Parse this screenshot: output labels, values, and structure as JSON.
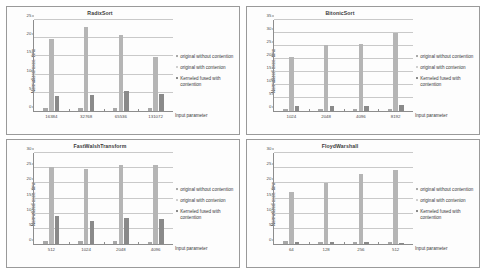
{
  "figure": {
    "xaxis_title": "Input parameter",
    "yaxis_title": "Normalized exec. time",
    "legend": [
      {
        "key": "s1",
        "label": "original without contention",
        "color": "#a8a8a8"
      },
      {
        "key": "s2",
        "label": "original with contenion",
        "color": "#cfcfcf"
      },
      {
        "key": "s3",
        "label": "Kerneled fused with contention",
        "color": "#8a8a8a"
      }
    ]
  },
  "chart_data": [
    {
      "type": "bar",
      "title": "RadixSort",
      "xlabel": "Input parameter",
      "ylabel": "Normalized exec. time",
      "categories": [
        "16384",
        "32768",
        "65536",
        "131072"
      ],
      "ylim": [
        0,
        25
      ],
      "yticks": [
        0,
        5,
        10,
        15,
        20,
        25
      ],
      "grid": true,
      "legend_position": "right",
      "series": [
        {
          "name": "original without contention",
          "values": [
            0.95,
            0.85,
            0.9,
            0.85
          ]
        },
        {
          "name": "original with contenion",
          "values": [
            19.7,
            23.0,
            20.9,
            14.9
          ]
        },
        {
          "name": "Kerneled fused with contention",
          "values": [
            4.1,
            4.3,
            5.4,
            4.8
          ]
        }
      ]
    },
    {
      "type": "bar",
      "title": "BitonicSort",
      "xlabel": "Input parameter",
      "ylabel": "Normalized exec. time",
      "categories": [
        "1024",
        "2048",
        "4096",
        "8192"
      ],
      "ylim": [
        0,
        35
      ],
      "yticks": [
        0,
        5,
        10,
        15,
        20,
        25,
        30,
        35
      ],
      "grid": true,
      "legend_position": "right",
      "series": [
        {
          "name": "original without contention",
          "values": [
            0.9,
            0.9,
            0.9,
            0.9
          ]
        },
        {
          "name": "original with contenion",
          "values": [
            20.8,
            25.4,
            25.8,
            30.0
          ]
        },
        {
          "name": "Kerneled fused with contention",
          "values": [
            1.8,
            1.8,
            2.0,
            2.5
          ]
        }
      ]
    },
    {
      "type": "bar",
      "title": "FastWalshTransform",
      "xlabel": "Input parameter",
      "ylabel": "Normalized exec. time",
      "categories": [
        "512",
        "1024",
        "2048",
        "4096"
      ],
      "ylim": [
        0,
        30
      ],
      "yticks": [
        0,
        5,
        10,
        15,
        20,
        25,
        30
      ],
      "grid": true,
      "legend_position": "right",
      "series": [
        {
          "name": "original without contention",
          "values": [
            0.9,
            0.85,
            0.85,
            0.8
          ]
        },
        {
          "name": "original with contenion",
          "values": [
            25.3,
            24.6,
            26.0,
            26.2
          ]
        },
        {
          "name": "Kerneled fused with contention",
          "values": [
            9.3,
            7.6,
            8.7,
            8.1
          ]
        }
      ]
    },
    {
      "type": "bar",
      "title": "FloydWarshall",
      "xlabel": "Input parameter",
      "ylabel": "Normalized exec. time",
      "categories": [
        "64",
        "128",
        "256",
        "512"
      ],
      "ylim": [
        0,
        30
      ],
      "yticks": [
        0,
        5,
        10,
        15,
        20,
        25,
        30
      ],
      "grid": true,
      "legend_position": "right",
      "series": [
        {
          "name": "original without contention",
          "values": [
            0.9,
            0.8,
            0.8,
            0.8
          ]
        },
        {
          "name": "original with contenion",
          "values": [
            17.3,
            20.1,
            23.1,
            24.5
          ]
        },
        {
          "name": "Kerneled fused with contention",
          "values": [
            0.8,
            0.5,
            0.5,
            0.4
          ]
        }
      ]
    }
  ]
}
